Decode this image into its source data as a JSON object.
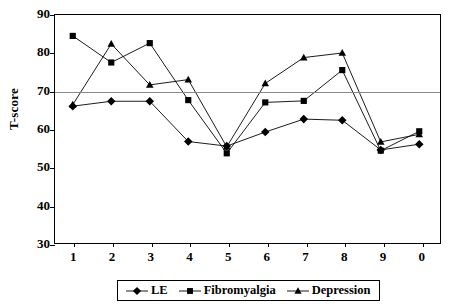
{
  "chart_data": {
    "type": "line",
    "title": "",
    "xlabel": "",
    "ylabel": "T-score",
    "x": [
      1,
      2,
      3,
      4,
      5,
      6,
      7,
      8,
      9,
      10
    ],
    "x_tick_labels": [
      "1",
      "2",
      "3",
      "4",
      "5",
      "6",
      "7",
      "8",
      "9",
      "0"
    ],
    "y_tick_labels": [
      "30",
      "40",
      "50",
      "60",
      "70",
      "80",
      "90"
    ],
    "y_ticks": [
      30,
      40,
      50,
      60,
      70,
      80,
      90
    ],
    "ylim": [
      30,
      90
    ],
    "grid": "horizontal-reference-line-at-70",
    "reference_line": 70,
    "legend_position": "bottom-center",
    "series": [
      {
        "name": "LE",
        "marker": "diamond",
        "color": "#000000",
        "values": [
          66.0,
          67.3,
          67.3,
          56.7,
          55.5,
          59.2,
          62.6,
          62.3,
          54.5,
          56.0
        ]
      },
      {
        "name": "Fibromyalgia",
        "marker": "square",
        "color": "#000000",
        "values": [
          84.5,
          77.5,
          82.6,
          67.6,
          53.6,
          67.0,
          67.4,
          75.5,
          54.3,
          59.4
        ]
      },
      {
        "name": "Depression",
        "marker": "triangle",
        "color": "#000000",
        "values": [
          66.4,
          82.4,
          71.6,
          73.0,
          55.3,
          72.0,
          78.8,
          80.0,
          56.6,
          58.6
        ]
      }
    ]
  },
  "legend": {
    "items": [
      {
        "label": "LE",
        "marker": "diamond-marker-icon"
      },
      {
        "label": "Fibromyalgia",
        "marker": "square-marker-icon"
      },
      {
        "label": "Depression",
        "marker": "triangle-marker-icon"
      }
    ]
  }
}
